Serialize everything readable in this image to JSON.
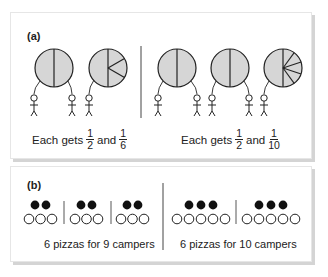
{
  "panel_a": {
    "label": "(a)",
    "left_scenario": {
      "pizzas": [
        {
          "slices": 2,
          "description": "pizza cut in halves"
        },
        {
          "slices": "1 half + 3 sixths",
          "description": "pizza cut into one half and three sixths"
        }
      ],
      "campers": 3,
      "caption": {
        "prefix": "Each gets",
        "frac1_num": "1",
        "frac1_den": "2",
        "joiner": "and",
        "frac2_num": "1",
        "frac2_den": "6"
      }
    },
    "right_scenario": {
      "pizzas": [
        {
          "slices": 2,
          "description": "pizza cut in halves"
        },
        {
          "slices": 2,
          "description": "pizza cut in halves"
        },
        {
          "slices": "1 half + 5 tenths",
          "description": "pizza cut into one half and five tenths"
        }
      ],
      "campers": 5,
      "caption": {
        "prefix": "Each gets",
        "frac1_num": "1",
        "frac1_den": "2",
        "joiner": "and",
        "frac2_num": "1",
        "frac2_den": "10"
      }
    }
  },
  "panel_b": {
    "label": "(b)",
    "left_scenario": {
      "groups": 3,
      "pizzas_per_group": 2,
      "campers_per_group": 3,
      "caption": "6 pizzas for 9 campers"
    },
    "right_scenario": {
      "groups": 2,
      "pizzas_per_group": 3,
      "campers_per_group": 5,
      "caption": "6 pizzas for 10 campers"
    }
  },
  "colors": {
    "pizza_fill": "#d6d6d6",
    "stroke": "#222222",
    "shadow": "#d4d4d4"
  }
}
